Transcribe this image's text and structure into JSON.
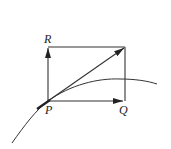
{
  "diagram": {
    "type": "vector-parallelogram-tangent",
    "labels": {
      "R": "R",
      "P": "P",
      "Q": "Q"
    },
    "colors": {
      "stroke": "#333333",
      "background": "#ffffff"
    },
    "elements": [
      {
        "kind": "rectangle",
        "corners": [
          "P",
          "Q",
          "corner",
          "R"
        ]
      },
      {
        "kind": "arrow",
        "from": "P",
        "to": "R",
        "direction": "up"
      },
      {
        "kind": "arrow",
        "from": "P",
        "to": "Q",
        "direction": "right"
      },
      {
        "kind": "arrow",
        "from": "P",
        "to": "opposite-corner",
        "direction": "diagonal"
      },
      {
        "kind": "curve",
        "description": "path through P, tangent to diagonal"
      }
    ]
  }
}
